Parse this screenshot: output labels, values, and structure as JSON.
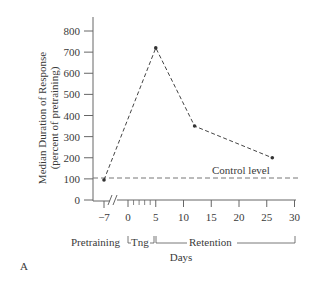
{
  "chart_data": {
    "type": "line",
    "title": "",
    "panel_label": "A",
    "xlabel": "Days",
    "ylabel": "Median Duration of Response",
    "ylabel_sub": "(percent of pretraining)",
    "ylim": [
      0,
      800
    ],
    "yticks": [
      "0",
      "100",
      "200",
      "300",
      "400",
      "500",
      "600",
      "700",
      "800"
    ],
    "xticks": [
      "-7",
      "0",
      "5",
      "10",
      "15",
      "20",
      "25",
      "30"
    ],
    "xlim": [
      -7,
      30
    ],
    "grid": false,
    "axis_break": "between -7 and 0",
    "series": [
      {
        "name": "Median duration",
        "style": "dashed",
        "x": [
          -7,
          5,
          12,
          26
        ],
        "y": [
          95,
          720,
          350,
          200
        ]
      }
    ],
    "reference_line": {
      "label": "Control level",
      "y": 100,
      "style": "dashed"
    },
    "phases": [
      {
        "label": "Pretraining",
        "range": [
          -7,
          -7
        ]
      },
      {
        "label": "Tng",
        "range": [
          0,
          5
        ]
      },
      {
        "label": "Retention",
        "range": [
          5,
          30
        ]
      }
    ]
  }
}
